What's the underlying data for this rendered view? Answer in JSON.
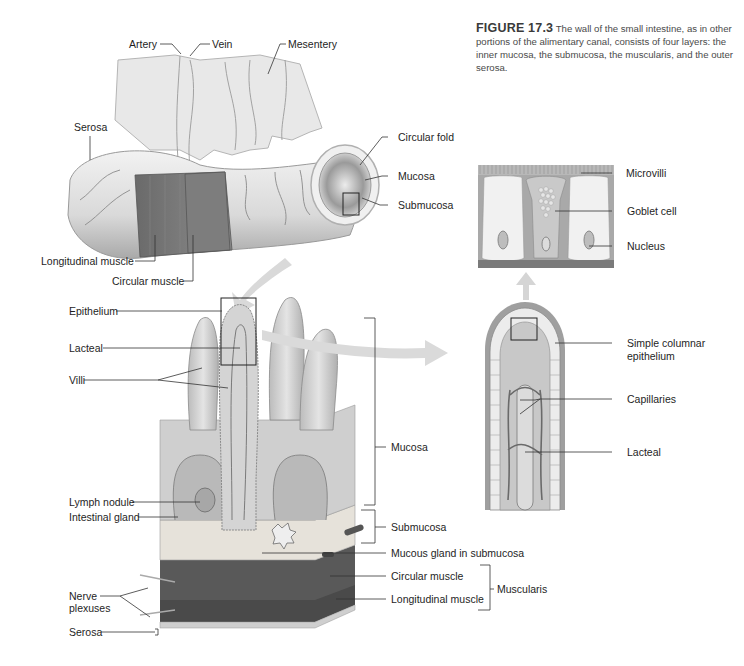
{
  "caption": {
    "figure_number": "FIGURE 17.3",
    "text": "The wall of the small intestine, as in other portions of the alimentary canal, consists of four layers: the inner mucosa, the submucosa, the muscularis, and the outer serosa."
  },
  "panels": {
    "tube": {
      "labels": {
        "artery": "Artery",
        "vein": "Vein",
        "mesentery": "Mesentery",
        "serosa": "Serosa",
        "circular_fold": "Circular fold",
        "mucosa": "Mucosa",
        "submucosa": "Submucosa",
        "longitudinal_muscle": "Longitudinal muscle",
        "circular_muscle": "Circular muscle"
      }
    },
    "cells": {
      "labels": {
        "microvilli": "Microvilli",
        "goblet_cell": "Goblet cell",
        "nucleus": "Nucleus"
      }
    },
    "villus": {
      "labels": {
        "simple_columnar_line1": "Simple columnar",
        "simple_columnar_line2": "epithelium",
        "capillaries": "Capillaries",
        "lacteal": "Lacteal"
      }
    },
    "wall_block": {
      "labels": {
        "epithelium": "Epithelium",
        "lacteal": "Lacteal",
        "villi": "Villi",
        "lymph_nodule": "Lymph nodule",
        "intestinal_gland": "Intestinal gland",
        "nerve_line1": "Nerve",
        "nerve_line2": "plexuses",
        "serosa": "Serosa",
        "mucosa": "Mucosa",
        "submucosa": "Submucosa",
        "mucous_gland": "Mucous gland in submucosa",
        "circular_muscle": "Circular muscle",
        "longitudinal_muscle": "Longitudinal muscle",
        "muscularis": "Muscularis"
      }
    }
  },
  "colors": {
    "tissue_light": "#e6e6e6",
    "tissue_mid": "#bdbdbd",
    "muscle_dark": "#6f6f6f",
    "vessel": "#7a7a7a",
    "arrow": "#d8d8d8",
    "leader_line": "#333333"
  }
}
